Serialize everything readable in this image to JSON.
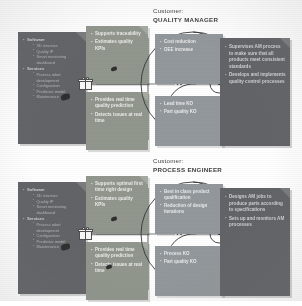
{
  "meta": {
    "colors": {
      "panel_dark": "#5f6369",
      "card_green": "#8d9b84",
      "profile_blue_grey": "#8f9aa3",
      "background": "#ffffff",
      "text_light": "#d2d5d9"
    }
  },
  "halves": [
    {
      "id": "quality-manager",
      "customer": {
        "label": "Customer:",
        "role": "QUALITY MANAGER"
      },
      "value_map": {
        "groups": [
          {
            "title": "Software",
            "items": [
              "3D structure",
              "Quality IP",
              "Smart monitoring dashboard"
            ]
          },
          {
            "title": "Services",
            "items": [
              "Process robot development",
              "Configuration",
              "Predictive model",
              "Maintenance"
            ]
          }
        ]
      },
      "benefit_cards": [
        {
          "id": "gains-creator",
          "items": [
            "Supports traceability",
            "Estimates quality KPIs"
          ]
        },
        {
          "id": "pain-reliever",
          "items": [
            "Provides real time quality prediction",
            "Detects issues at real time"
          ]
        }
      ],
      "profile": {
        "gains": [
          "Cost reduction",
          "OEE increase"
        ],
        "pains": [
          "Lead time KO",
          "Part quality KO"
        ],
        "jobs": [
          "Supervises AM process to make sure that all products meet consistent standards",
          "Develops and implements quality control processes"
        ]
      }
    },
    {
      "id": "process-engineer",
      "customer": {
        "label": "Customer:",
        "role": "PROCESS ENGINEER"
      },
      "value_map": {
        "groups": [
          {
            "title": "Software",
            "items": [
              "3D structure",
              "Quality IP",
              "Smart monitoring dashboard"
            ]
          },
          {
            "title": "Services",
            "items": [
              "Process robot development",
              "Configuration",
              "Predictive model",
              "Maintenance"
            ]
          }
        ]
      },
      "benefit_cards": [
        {
          "id": "gains-creator",
          "items": [
            "Supports optimal first time right design",
            "Estimates quality KPIs"
          ]
        },
        {
          "id": "pain-reliever",
          "items": [
            "Provides real time quality prediction",
            "Detects issues at real time"
          ]
        }
      ],
      "profile": {
        "gains": [
          "Best in class product qualification",
          "Reduction of design iterations"
        ],
        "pains": [
          "Process KO",
          "Part quality KO"
        ],
        "jobs": [
          "Designs AM jobs to produce parts according to specifications",
          "Sets up and monitors AM processes"
        ]
      }
    }
  ],
  "icons": {
    "gift": "gift-icon",
    "cursor": "cursor-pointer-icon",
    "fold": "page-fold-icon"
  }
}
